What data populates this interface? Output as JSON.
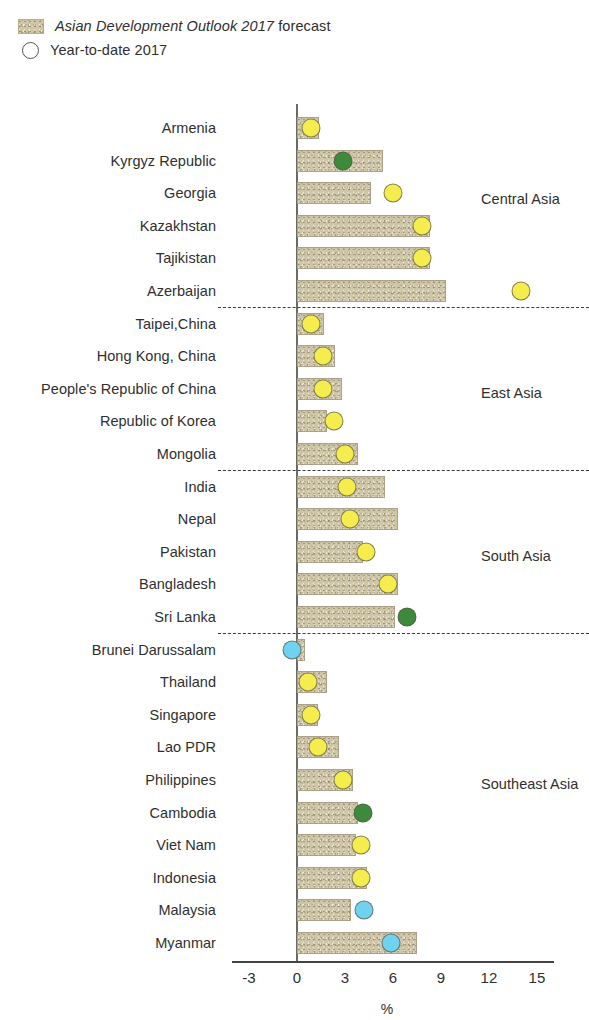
{
  "legend": {
    "forecast_label_italic": "Asian Development Outlook 2017",
    "forecast_label_rest": " forecast",
    "ytd_label": "Year-to-date 2017",
    "swatch_color": "#cfc6a8",
    "circle_color": "#ffffff"
  },
  "axis": {
    "title": "%",
    "ticks": [
      "-3",
      "0",
      "3",
      "6",
      "9",
      "12",
      "15"
    ],
    "tick_values": [
      -3,
      0,
      3,
      6,
      9,
      12,
      15
    ],
    "min": -3,
    "max": 15
  },
  "regions": [
    {
      "label": "Central Asia"
    },
    {
      "label": "East Asia"
    },
    {
      "label": "South Asia"
    },
    {
      "label": "Southeast Asia"
    }
  ],
  "chart_data": {
    "type": "bar",
    "title": "",
    "xlabel": "%",
    "ylabel": "",
    "xlim": [
      -3,
      15
    ],
    "grid": false,
    "legend_position": "top-left",
    "orientation": "horizontal",
    "categories": [
      "Armenia",
      "Kyrgyz Republic",
      "Georgia",
      "Kazakhstan",
      "Tajikistan",
      "Azerbaijan",
      "Taipei,China",
      "Hong Kong, China",
      "People's Republic of China",
      "Republic of Korea",
      "Mongolia",
      "India",
      "Nepal",
      "Pakistan",
      "Bangladesh",
      "Sri Lanka",
      "Brunei Darussalam",
      "Thailand",
      "Singapore",
      "Lao PDR",
      "Philippines",
      "Cambodia",
      "Viet Nam",
      "Indonesia",
      "Malaysia",
      "Myanmar"
    ],
    "series": [
      {
        "name": "Asian Development Outlook 2017 forecast",
        "type": "bar",
        "values": [
          1.4,
          5.4,
          4.6,
          8.3,
          8.3,
          9.3,
          1.7,
          2.4,
          2.8,
          1.9,
          3.8,
          5.5,
          6.3,
          4.1,
          6.3,
          6.1,
          0.5,
          1.9,
          1.3,
          2.6,
          3.5,
          3.8,
          3.7,
          4.4,
          3.4,
          7.5
        ]
      },
      {
        "name": "Year-to-date 2017",
        "type": "scatter",
        "values": [
          0.9,
          2.9,
          6.0,
          7.8,
          7.8,
          14.0,
          0.9,
          1.6,
          1.6,
          2.3,
          3.0,
          3.1,
          3.3,
          4.3,
          5.7,
          6.9,
          -0.3,
          0.7,
          0.9,
          1.3,
          2.9,
          4.1,
          4.0,
          4.0,
          4.2,
          5.9
        ],
        "colors": [
          "#f5ec4e",
          "#3d8a3d",
          "#f5ec4e",
          "#f5ec4e",
          "#f5ec4e",
          "#f5ec4e",
          "#f5ec4e",
          "#f5ec4e",
          "#f5ec4e",
          "#f5ec4e",
          "#f5ec4e",
          "#f5ec4e",
          "#f5ec4e",
          "#f5ec4e",
          "#f5ec4e",
          "#3d8a3d",
          "#6fd3ef",
          "#f5ec4e",
          "#f5ec4e",
          "#f5ec4e",
          "#f5ec4e",
          "#3d8a3d",
          "#f5ec4e",
          "#f5ec4e",
          "#6fd3ef",
          "#6fd3ef"
        ]
      }
    ],
    "region_groups": [
      {
        "label": "Central Asia",
        "start": 0,
        "end": 5
      },
      {
        "label": "East Asia",
        "start": 6,
        "end": 10
      },
      {
        "label": "South Asia",
        "start": 11,
        "end": 15
      },
      {
        "label": "Southeast Asia",
        "start": 16,
        "end": 25
      }
    ]
  }
}
